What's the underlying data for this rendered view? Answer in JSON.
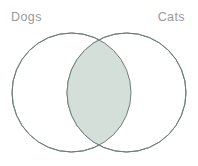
{
  "figure": {
    "type": "venn-diagram",
    "background_color": "#ffffff",
    "width": 198,
    "height": 166
  },
  "labels": {
    "left": "Dogs",
    "right": "Cats",
    "text_color": "#9a9a9a"
  },
  "sets": [
    {
      "name": "Dogs",
      "side": "left",
      "icon": "circle-outline-icon",
      "center_x": 71.5,
      "center_y": 92.5,
      "radius": 59.5,
      "stroke_color": "#6f7d78",
      "fill_color": "#ffffff"
    },
    {
      "name": "Cats",
      "side": "right",
      "icon": "circle-outline-icon",
      "center_x": 126.5,
      "center_y": 92.5,
      "radius": 59.5,
      "stroke_color": "#6f7d78",
      "fill_color": "#ffffff"
    }
  ],
  "intersection": {
    "label": "",
    "fill_color": "#d5dfda",
    "stroke_color": "#6f7d78",
    "top_point_x": 99,
    "top_point_y": 36,
    "bottom_point_x": 99,
    "bottom_point_y": 149,
    "left_point_x": 67,
    "left_point_y": 92.5,
    "right_point_x": 131,
    "right_point_y": 92.5
  },
  "style": {
    "stroke_width": 1,
    "label_font_size": 12.5
  }
}
